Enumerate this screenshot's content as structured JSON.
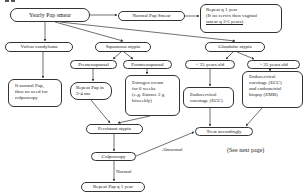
{
  "diagram": {
    "type": "flowchart",
    "nodes": {
      "yearly_pap": "Yearly Pap smear",
      "normal_pap": "Normal Pap Smear",
      "repeat_q1": [
        "Repeat q 1 year",
        "(If no cervix then vaginal",
        "smear q 3-5 years)"
      ],
      "vulvar": "Vulvar condyloma",
      "squamous": "Squamous atypia",
      "glandular": "Glandular atypia",
      "if_normal": [
        "If normal Pap,",
        "then no need for",
        "colposcopy"
      ],
      "premenopausal": "Premenopausal",
      "postmenopausal": "Postmenopausal",
      "repeat_pap_34": [
        "Repeat Pap in",
        "3-4 mo"
      ],
      "estrogen": [
        "Estrogen cream",
        "for 6 weeks",
        "(e.g. Estrace 2 g",
        "biweekly)"
      ],
      "lt35": "< 35 years old",
      "gt35": "> 35 years old",
      "ecc": [
        "Endocervical",
        "curettage (ECC)"
      ],
      "ecc_emb": [
        "Endocervical",
        "curettage (ECC)",
        "and endometrial",
        "biopsy (EMB)"
      ],
      "persistent": "Persistant atypia",
      "treat": "Treat accordingly",
      "colposcopy": "Colposcopy",
      "repeat_final": "Repeat Pap q 1 year"
    },
    "labels": {
      "abnormal": "Abnormal",
      "normal": "Normal",
      "see_next": "(See next page)"
    },
    "edges": [
      [
        "yearly_pap",
        "normal_pap"
      ],
      [
        "normal_pap",
        "repeat_q1"
      ],
      [
        "yearly_pap",
        "vulvar"
      ],
      [
        "yearly_pap",
        "squamous"
      ],
      [
        "yearly_pap",
        "glandular"
      ],
      [
        "vulvar",
        "if_normal"
      ],
      [
        "squamous",
        "premenopausal"
      ],
      [
        "squamous",
        "postmenopausal"
      ],
      [
        "premenopausal",
        "repeat_pap_34"
      ],
      [
        "postmenopausal",
        "estrogen"
      ],
      [
        "glandular",
        "lt35"
      ],
      [
        "glandular",
        "gt35"
      ],
      [
        "lt35",
        "ecc"
      ],
      [
        "gt35",
        "ecc_emb"
      ],
      [
        "repeat_pap_34",
        "persistent"
      ],
      [
        "estrogen",
        "persistent"
      ],
      [
        "ecc",
        "treat"
      ],
      [
        "ecc_emb",
        "treat"
      ],
      [
        "persistent",
        "colposcopy"
      ],
      [
        "colposcopy",
        "treat",
        "Abnormal"
      ],
      [
        "colposcopy",
        "repeat_final",
        "Normal"
      ]
    ]
  }
}
